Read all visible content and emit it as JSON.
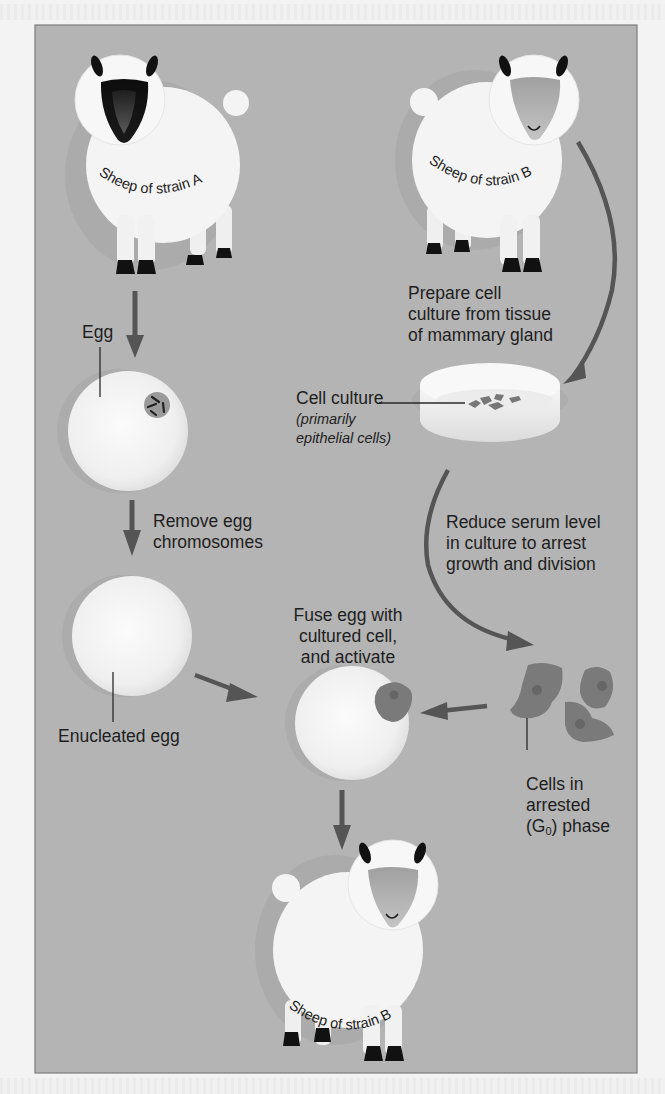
{
  "figure": {
    "colors": {
      "background": "#b4b4b4",
      "frame_border": "#7d7d7d",
      "arrow": "#555555",
      "cell": "#7a7a7a",
      "wool": "#f4f4f4",
      "face_strain_a": "#111111",
      "face_strain_b": "#a8a8a8"
    },
    "sheep": {
      "donor_egg": {
        "label": "Sheep of strain A"
      },
      "donor_cell": {
        "label": "Sheep of strain B"
      },
      "clone": {
        "label": "Sheep of strain B"
      }
    },
    "labels": {
      "egg": "Egg",
      "remove_chromosomes_line1": "Remove egg",
      "remove_chromosomes_line2": "chromosomes",
      "enucleated_egg": "Enucleated egg",
      "prepare_line1": "Prepare cell",
      "prepare_line2": "culture from tissue",
      "prepare_line3": "of mammary gland",
      "cell_culture": "Cell culture",
      "cell_culture_note_line1": "(primarily",
      "cell_culture_note_line2": "epithelial cells)",
      "reduce_line1": "Reduce serum level",
      "reduce_line2": "in culture to arrest",
      "reduce_line3": "growth and division",
      "fuse_line1": "Fuse egg with",
      "fuse_line2": "cultured cell,",
      "fuse_line3": "and activate",
      "arrested_line1": "Cells in",
      "arrested_line2": "arrested",
      "arrested_line3_prefix": "(G",
      "arrested_line3_sub": "0",
      "arrested_line3_suffix": ") phase"
    }
  }
}
